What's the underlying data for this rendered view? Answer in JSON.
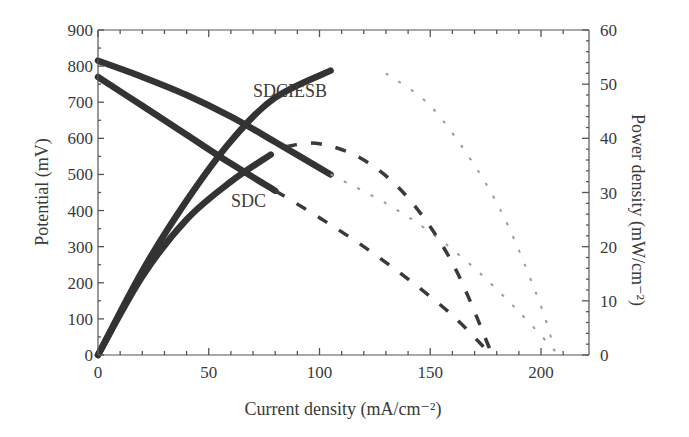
{
  "chart_data": {
    "type": "line",
    "title": "",
    "xlabel": "Current density (mA/cm⁻²)",
    "ylabel": "Potential (mV)",
    "y2label": "Power density (mW/cm⁻²)",
    "xlim": [
      0,
      215
    ],
    "ylim": [
      0,
      900
    ],
    "y2lim": [
      0,
      60
    ],
    "x_ticks": [
      0,
      50,
      100,
      150,
      200
    ],
    "y_ticks": [
      0,
      100,
      200,
      300,
      400,
      500,
      600,
      700,
      800,
      900
    ],
    "y2_ticks": [
      0,
      10,
      20,
      30,
      40,
      50,
      60
    ],
    "grid": false,
    "legend": "inline labels",
    "annotations": [
      {
        "text": "SDCIESB",
        "x": 72,
        "y": 750
      },
      {
        "text": "SDC",
        "x": 60,
        "y": 435
      }
    ],
    "series": [
      {
        "name": "SDCIESB potential (measured)",
        "axis": "left",
        "style": "solid-thick",
        "x": [
          0,
          20,
          40,
          60,
          80,
          105
        ],
        "values": [
          815,
          770,
          720,
          660,
          590,
          500
        ]
      },
      {
        "name": "SDCIESB potential (fit)",
        "axis": "left",
        "style": "dotted",
        "x": [
          105,
          130,
          150,
          170,
          190,
          208
        ],
        "values": [
          500,
          420,
          340,
          240,
          120,
          0
        ]
      },
      {
        "name": "SDCIESB power (measured)",
        "axis": "right",
        "style": "solid-thick",
        "x": [
          0,
          20,
          40,
          60,
          80,
          105
        ],
        "values": [
          0,
          15.5,
          28.5,
          39.5,
          47.5,
          52.5
        ]
      },
      {
        "name": "SDCIESB power (fit)",
        "axis": "right",
        "style": "dotted",
        "x": [
          130,
          150,
          170,
          185,
          200,
          206
        ],
        "values": [
          52,
          46,
          35,
          24,
          9,
          1
        ]
      },
      {
        "name": "SDC potential (measured)",
        "axis": "left",
        "style": "solid-thick",
        "x": [
          0,
          20,
          40,
          60,
          80
        ],
        "values": [
          770,
          690,
          610,
          530,
          455
        ]
      },
      {
        "name": "SDC potential (fit)",
        "axis": "left",
        "style": "dashed",
        "x": [
          80,
          100,
          120,
          140,
          160,
          176
        ],
        "values": [
          455,
          380,
          300,
          210,
          110,
          10
        ]
      },
      {
        "name": "SDC power (measured)",
        "axis": "right",
        "style": "solid-thick",
        "x": [
          0,
          20,
          40,
          60,
          78
        ],
        "values": [
          0,
          14.5,
          25,
          32,
          37
        ]
      },
      {
        "name": "SDC power (fit)",
        "axis": "right",
        "style": "dashed",
        "x": [
          85,
          100,
          120,
          140,
          160,
          177
        ],
        "values": [
          38.5,
          39,
          36,
          29,
          17,
          1
        ]
      }
    ]
  },
  "labels": {
    "xlabel": "Current density (mA/cm⁻²)",
    "ylabel": "Potential (mV)",
    "y2label": "Power density (mW/cm⁻²)",
    "series_sdciesb": "SDCIESB",
    "series_sdc": "SDC"
  }
}
